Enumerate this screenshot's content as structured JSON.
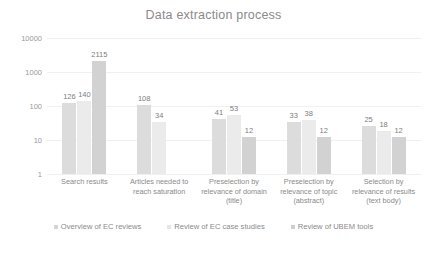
{
  "chart_data": {
    "type": "bar",
    "title": "Data extraction process",
    "xlabel": "",
    "ylabel": "",
    "yscale": "log",
    "ylim": [
      1,
      10000
    ],
    "yticks": [
      1,
      10,
      100,
      1000,
      10000
    ],
    "ytick_labels": [
      "1",
      "10",
      "100",
      "1000",
      "10000"
    ],
    "grid": true,
    "legend_position": "bottom",
    "categories": [
      "Search results",
      "Articles needed to reach saturation",
      "Preselection by relevance of domain (title)",
      "Preselection by relevance of topic (abstract)",
      "Selection by relevance of results (text body)"
    ],
    "category_lines": [
      [
        "Search results"
      ],
      [
        "Articles needed to",
        "reach saturation"
      ],
      [
        "Preselection by",
        "relevance of domain",
        "(title)"
      ],
      [
        "Preselection by",
        "relevance of topic",
        "(abstract)"
      ],
      [
        "Selection by",
        "relevance of results",
        "(text body)"
      ]
    ],
    "series": [
      {
        "name": "Overview of EC reviews",
        "color": "#dcdcdc",
        "values": [
          126,
          108,
          41,
          33,
          25
        ]
      },
      {
        "name": "Review of EC case studies",
        "color": "#ebebeb",
        "values": [
          140,
          34,
          53,
          38,
          18
        ]
      },
      {
        "name": "Review of UBEM tools",
        "color": "#d2d2d2",
        "values": [
          2115,
          null,
          12,
          12,
          12
        ]
      }
    ]
  }
}
